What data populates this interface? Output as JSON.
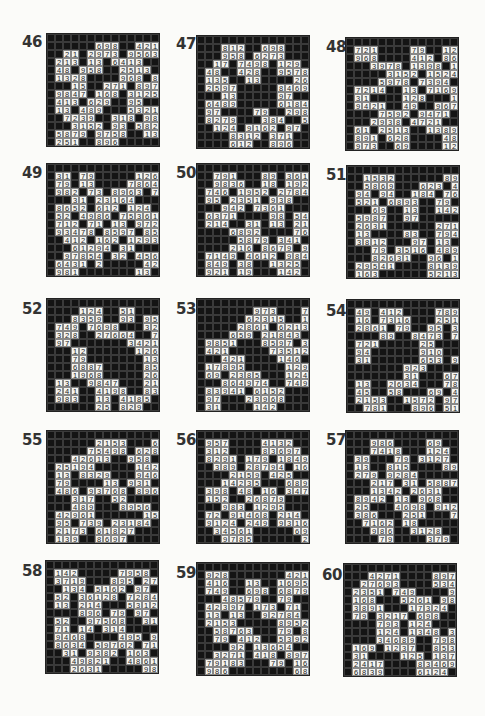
{
  "page": {
    "legend": {
      "black_cell": "#",
      "white_cell_digit": "0-9"
    }
  },
  "puzzles": [
    {
      "number": "46",
      "x": 46,
      "y": 33,
      "label_x": 22,
      "label_y": 45,
      "rows": [
        "##############",
        "######698##421",
        "##21#2973#9563",
        "#213#13#6413##",
        "#48#958##2513#",
        "#1328####968#89",
        "###15##271#897",
        "#9847#168#3125",
        "#413#629##95##",
        "#13#489###5321",
        "##7239##318#98",
        "###3152#93#582",
        "#5879#9758##13#",
        "#251##896#####"
      ]
    },
    {
      "number": "47",
      "x": 196,
      "y": 35,
      "label_x": 176,
      "label_y": 47,
      "rows": [
        "##############",
        "###812##698###",
        "###958#6273###",
        "##17#7498#129#",
        "#48##428##9578",
        "#135##13####26",
        "#2597#####8469",
        "###13#####97##",
        "#6489#####6184",
        "#97####79##298",
        "#8279###384##53",
        "##124#9162#97#",
        "####8312#371##",
        "####612##896##"
      ]
    },
    {
      "number": "48",
      "x": 345,
      "y": 37,
      "label_x": 326,
      "label_y": 50,
      "rows": [
        "##############",
        "#721####79##127",
        "#968####412#869",
        "###3978#1398#13",
        "#####3152#1524#",
        "####5978#7394##",
        "#7214##13#7169",
        "#31####128###17",
        "#9421##49##9678",
        "####7592#9471##",
        "###2938#4721###",
        "#61#2513##1389#",
        "#891#628####489",
        "#973##69####127"
      ]
    },
    {
      "number": "49",
      "x": 46,
      "y": 163,
      "label_x": 22,
      "label_y": 176,
      "rows": [
        "##############",
        "#31#79#####126",
        "#79#13####78649",
        "#982#73#8963 7#",
        "###31#23164###",
        "#8652#612#124#",
        "#52#4986#75361",
        "#712#71#13#972",
        "#93478#8597#85",
        "##412#162#1293",
        "###61294#31###",
        "##97854#32#456",
        "#6431 2#####42#18",
        "#981#######13#79"
      ]
    },
    {
      "number": "50",
      "x": 196,
      "y": 163,
      "label_x": 176,
      "label_y": 176,
      "rows": [
        "##############",
        "##791###89#361",
        "##9836##18#192",
        "#746#1952#2784",
        "#95#2351#938##",
        "###942#7361###",
        "#6371####98 54#",
        "#214##31#13#215",
        "####6892####7629",
        "#####5879#341##",
        "####216#8679#91",
        "#7149#4612#984",
        "#849#38##1325#",
        "#921#19###142#"
      ]
    },
    {
      "number": "51",
      "x": 346,
      "y": 165,
      "label_x": 326,
      "label_y": 178,
      "rows": [
        "##############",
        "##1532######894",
        "##5869###623 41",
        "#94#94##184 76#",
        "#521#6893##79##",
        "###69##13##1427",
        "#5987##97#####79",
        "#2631######2713",
        "#13####83##7948",
        "#3812###97#13##",
        "###79#3516#489",
        "###82631##96#14",
        "#29541####8139#",
        "#163######5213#"
      ]
    },
    {
      "number": "52",
      "x": 46,
      "y": 298,
      "label_x": 22,
      "label_y": 312,
      "rows": [
        "##############",
        "####124##51####",
        "###8359##93#958",
        "#749#7698###321",
        "#328##27664##79",
        "#97#######3421#",
        "###12######126##",
        "###79#######13##",
        "###6887#####85#",
        "###1968#####26",
        "#13##9847###218",
        "#241##4198##839",
        "#983##13#4185##",
        "######25#829###"
      ]
    },
    {
      "number": "53",
      "x": 196,
      "y": 298,
      "label_x": 176,
      "label_y": 312,
      "rows": [
        "##############",
        "#######973###79",
        "######62315##14",
        "#####2861#62138",
        "####659#21843##",
        "#9851###8597#31",
        "#421#####73512",
        "###421####146#",
        "#17895#####129",
        "#69#2385###1247",
        "###864974##749##",
        "#83941#6152###",
        "#97###23968####",
        "#31####142#####"
      ]
    },
    {
      "number": "54",
      "x": 346,
      "y": 299,
      "label_x": 326,
      "label_y": 314,
      "rows": [
        "##############",
        "#49#412####789",
        "#16#7316###2513",
        "#2861#79##95#38",
        "####89##8473#79",
        "#721#####25####",
        "#94######910###",
        "#31######653#91",
        "#######923####84",
        "#######31###672",
        "#13##2634###78##",
        "#45##58###69#4983",
        "#2153##1572#97",
        "##781###896#51"
      ]
    },
    {
      "number": "55",
      "x": 46,
      "y": 430,
      "label_x": 22,
      "label_y": 443,
      "rows": [
        "##############",
        "######2153###698",
        "#####75498#6281",
        "###42613##958#42",
        "#25194#####14273",
        "#13#8329###946#",
        "#79####13#931##",
        "#486#93768#896",
        "###317##52####62",
        "###489###8956#31",
        "#42961######15974",
        "#95#739#23184#",
        "#2173#61827###",
        "#139##8697####"
      ]
    },
    {
      "number": "56",
      "x": 196,
      "y": 430,
      "label_x": 176,
      "label_y": 443,
      "rows": [
        "##############",
        "#957####4132##",
        "#312####83697#",
        "#8291#179#1849",
        "##389#28794#16",
        "####2159#425##",
        "###14235###689",
        "#398#48#16#347",
        "#152##26879###",
        "###983#1295###",
        "#72#91468#214#",
        "#9124#249#9316",
        "##34561#####698",
        "###9785######239"
      ]
    },
    {
      "number": "57",
      "x": 345,
      "y": 430,
      "label_x": 326,
      "label_y": 443,
      "rows": [
        "##############",
        "###986####69##",
        "###7418###124#",
        "#39###79#3127#",
        "#13##815####893",
        "#279#9284#####41",
        "###217#31#5887",
        "###1342#2631###",
        "#8942#13#968##",
        "#25###4698#912",
        "#386###251###79",
        "##7162#18#####31",
        "###986##3128##",
        "####79####379##"
      ]
    },
    {
      "number": "58",
      "x": 45,
      "y": 560,
      "label_x": 22,
      "label_y": 574,
      "rows": [
        "##############",
        "#142#####7958#",
        "#3719###895 27#",
        "##134#5162#97#",
        "#52#36128#7284",
        "#13#214###5312",
        "####896#79#97",
        "#52##97568##31",
        "#71#14#314####",
        "#9468####495#92",
        "#8634#59762#71",
        "##31#9382#163#",
        "###49821##4861",
        "###2631#####985"
      ]
    },
    {
      "number": "59",
      "x": 196,
      "y": 562,
      "label_x": 176,
      "label_y": 576,
      "rows": [
        "##############",
        "#928#######421",
        "#416##13##16953",
        "#749##698#6879#",
        "###48579##79###",
        "#42397#173#71##",
        "#13#13##92784#",
        "#2153#####8952",
        "##58763###79#84",
        "##79#412##53921",
        "####92#13654##",
        "##3271#418#897",
        "#79183###79#163",
        "#986########689"
      ]
    },
    {
      "number": "60",
      "x": 343,
      "y": 563,
      "label_x": 322,
      "label_y": 578,
      "rows": [
        "##############",
        "###4271####8973",
        "##27693####5341",
        "#2351#749####94",
        "#168###5261#982",
        "#3891###17324##",
        "#79#3217#698##",
        "####793#124###",
        "####124#1348#31",
        "####34689##7985",
        "#169#1237##853",
        "#31####125#1374",
        "#2417####83469#",
        "#6839####6124##"
      ]
    }
  ]
}
